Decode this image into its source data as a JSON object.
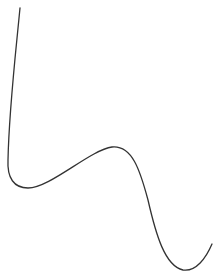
{
  "canvas": {
    "width": 219,
    "height": 275,
    "background": "#ffffff"
  },
  "curve": {
    "stroke": "#333333",
    "stroke_width": 1.3,
    "path": "M20,8 C15,60 9,110 8,160 C7,178 14,188 28,188 C50,188 90,150 112,147 C132,145 140,170 148,200 C156,235 165,266 183,270 C196,272 206,258 212,244"
  }
}
